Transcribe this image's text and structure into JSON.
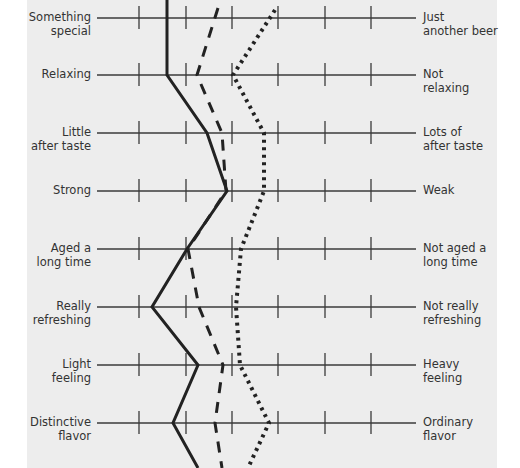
{
  "chart_data": {
    "type": "line",
    "title": "",
    "subtitle": "",
    "orientation": "semantic differential profile (vertical lines across horizontal scales)",
    "scale_points": 7,
    "tick_positions_x": [
      139,
      186,
      232,
      278,
      325,
      371
    ],
    "axis_x_range": [
      97,
      416
    ],
    "grid": false,
    "legend": null,
    "rows": [
      {
        "left": "Something special",
        "right": "Just another beer",
        "y": 18
      },
      {
        "left": "Relaxing",
        "right": "Not relaxing",
        "y": 75
      },
      {
        "left": "Little after taste",
        "right": "Lots of after taste",
        "y": 133
      },
      {
        "left": "Strong",
        "right": "Weak",
        "y": 191
      },
      {
        "left": "Aged a long time",
        "right": "Not aged a long time",
        "y": 249
      },
      {
        "left": "Really refreshing",
        "right": "Not really refreshing",
        "y": 307
      },
      {
        "left": "Light feeling",
        "right": "Heavy feeling",
        "y": 365
      },
      {
        "left": "Distinctive flavor",
        "right": "Ordinary flavor",
        "y": 423
      }
    ],
    "series": [
      {
        "name": "Beer A (solid)",
        "style": "solid",
        "x_pixels": [
          167,
          167,
          167,
          207,
          227,
          187,
          152,
          198,
          173,
          198
        ],
        "y_pixels": [
          0,
          18,
          75,
          133,
          191,
          249,
          307,
          365,
          423,
          468
        ],
        "values": [
          2.7,
          2.7,
          3.5,
          3.9,
          3.1,
          2.3,
          3.3,
          2.8
        ]
      },
      {
        "name": "Beer B (dashed)",
        "style": "dashed",
        "x_pixels": [
          218,
          197,
          222,
          226,
          188,
          199,
          223,
          215,
          222
        ],
        "y_pixels": [
          8,
          75,
          133,
          191,
          249,
          307,
          365,
          423,
          468
        ],
        "values": [
          3.6,
          3.3,
          3.8,
          3.9,
          3.1,
          3.3,
          3.8,
          3.6
        ]
      },
      {
        "name": "Beer C (dotted)",
        "style": "dotted",
        "x_pixels": [
          275,
          233,
          264,
          264,
          241,
          236,
          240,
          269,
          248
        ],
        "y_pixels": [
          10,
          75,
          133,
          191,
          249,
          307,
          365,
          423,
          468
        ],
        "values": [
          4.8,
          4.0,
          4.6,
          4.6,
          4.2,
          4.1,
          4.2,
          4.7
        ]
      }
    ],
    "xlabel": "",
    "ylabel": ""
  },
  "labels": {
    "left": [
      "Something special",
      "Relaxing",
      "Little after taste",
      "Strong",
      "Aged a long time",
      "Really refreshing",
      "Light feeling",
      "Distinctive flavor"
    ],
    "left_lines": [
      [
        "Something",
        "special"
      ],
      [
        "Relaxing"
      ],
      [
        "Little",
        "after taste"
      ],
      [
        "Strong"
      ],
      [
        "Aged a",
        "long time"
      ],
      [
        "Really",
        "refreshing"
      ],
      [
        "Light",
        "feeling"
      ],
      [
        "Distinctive",
        "flavor"
      ]
    ],
    "right_lines": [
      [
        "Just",
        "another beer"
      ],
      [
        "Not",
        "relaxing"
      ],
      [
        "Lots of",
        "after taste"
      ],
      [
        "Weak"
      ],
      [
        "Not aged a",
        "long time"
      ],
      [
        "Not really",
        "refreshing"
      ],
      [
        "Heavy",
        "feeling"
      ],
      [
        "Ordinary",
        "flavor"
      ]
    ]
  },
  "colors": {
    "panel": "#ededed",
    "axis": "#3a3a3a",
    "series": "#222222",
    "text": "#333333"
  }
}
